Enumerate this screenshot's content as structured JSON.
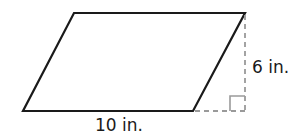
{
  "diagram": {
    "shape": "parallelogram",
    "base_label": "10 in.",
    "height_label": "6 in.",
    "colors": {
      "outline": "#1a1a1a",
      "dashed": "#9a9a9a",
      "text": "#1a1a1a",
      "background": "#ffffff"
    }
  }
}
